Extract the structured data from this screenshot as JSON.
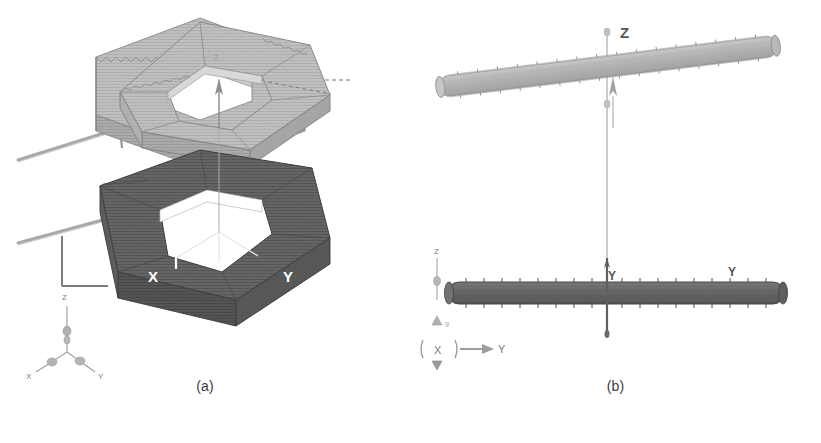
{
  "figure": {
    "background_color": "#ffffff",
    "panels": [
      {
        "id": "a",
        "caption": "(a)",
        "view": "isometric",
        "objects": [
          {
            "name": "upper-hexagonal-ring",
            "shade": "light",
            "color": "#c0c0c0",
            "edge_color": "#8a8a8a"
          },
          {
            "name": "lower-hexagonal-ring",
            "shade": "dark",
            "color": "#626262",
            "edge_color": "#3f3f3f"
          }
        ],
        "axis_labels": {
          "x": "X",
          "y": "Y",
          "z": "Z"
        },
        "triad": {
          "z": "Z",
          "x": "X",
          "y": "Y"
        }
      },
      {
        "id": "b",
        "caption": "(b)",
        "view": "front-elevation",
        "objects": [
          {
            "name": "upper-bar",
            "shade": "light",
            "color": "#b9b9b9",
            "edge_color": "#8d8d8d",
            "tilted": true
          },
          {
            "name": "lower-bar",
            "shade": "dark",
            "color": "#6b6b6b",
            "edge_color": "#4a4a4a",
            "tilted": false
          }
        ],
        "axis_labels": {
          "z": "Z",
          "y_left": "Y",
          "y_right": "Y"
        },
        "triad": {
          "z": "Z",
          "x": "X",
          "y": "Y"
        }
      }
    ]
  },
  "colors": {
    "light_gray": "#c0c0c0",
    "dark_gray": "#626262",
    "mid_gray": "#8a8a8a",
    "axis_line": "#8d8d8d",
    "caption_text": "#3b3b3b",
    "background": "#ffffff"
  }
}
